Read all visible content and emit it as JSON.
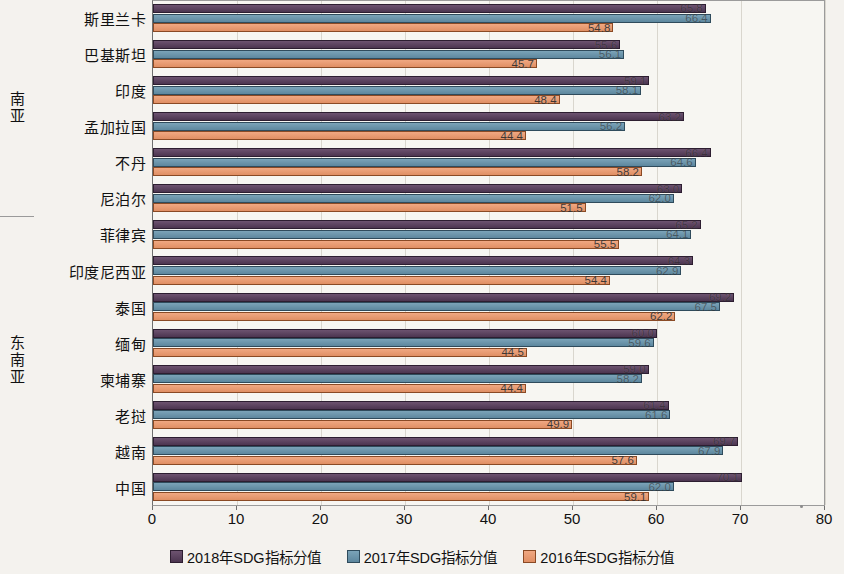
{
  "chart_data": {
    "type": "bar",
    "orientation": "horizontal",
    "title": "",
    "xlabel": "",
    "ylabel": "",
    "xlim": [
      0,
      80
    ],
    "xticks": [
      "0",
      "10",
      "20",
      "30",
      "40",
      "50",
      "60",
      "70",
      "80"
    ],
    "grid": true,
    "legend_position": "bottom",
    "categories": [
      "斯里兰卡",
      "巴基斯坦",
      "印度",
      "孟加拉国",
      "不丹",
      "尼泊尔",
      "菲律宾",
      "印度尼西亚",
      "泰国",
      "缅甸",
      "柬埔寨",
      "老挝",
      "越南",
      "中国"
    ],
    "groups": [
      {
        "label": "南亚",
        "categories": [
          "斯里兰卡",
          "巴基斯坦",
          "印度",
          "孟加拉国",
          "不丹",
          "尼泊尔"
        ]
      },
      {
        "label": "东南亚",
        "categories": [
          "菲律宾",
          "印度尼西亚",
          "泰国",
          "缅甸",
          "柬埔寨",
          "老挝",
          "越南",
          "中国"
        ]
      }
    ],
    "series": [
      {
        "name": "2018年SDG指标分值",
        "color": "#4c3550",
        "values": [
          65.8,
          55.6,
          59.1,
          63.2,
          66.4,
          63.0,
          65.2,
          64.3,
          69.2,
          60.0,
          59.0,
          61.4,
          69.7,
          70.1
        ],
        "labels": [
          "65.8",
          "55.6",
          "59.1",
          "63.2",
          "66.4",
          "63.0",
          "65.2",
          "64.3",
          "69.2",
          "60.0",
          "59.0",
          "61.4",
          "69.7",
          "70.1"
        ]
      },
      {
        "name": "2017年SDG指标分值",
        "color": "#5d879e",
        "values": [
          66.4,
          56.1,
          58.1,
          56.2,
          64.6,
          62.0,
          64.1,
          62.9,
          67.5,
          59.6,
          58.2,
          61.6,
          67.9,
          62.0
        ],
        "labels": [
          "66.4",
          "56.1",
          "58.1",
          "56.2",
          "64.6",
          "62.0",
          "64.1",
          "62.9",
          "67.5",
          "59.6",
          "58.2",
          "61.6",
          "67.9",
          "62.0"
        ]
      },
      {
        "name": "2016年SDG指标分值",
        "color": "#e08f64",
        "values": [
          54.8,
          45.7,
          48.4,
          44.4,
          58.2,
          51.5,
          55.5,
          54.4,
          62.2,
          44.5,
          44.4,
          49.9,
          57.6,
          59.1
        ],
        "labels": [
          "54.8",
          "45.7",
          "48.4",
          "44.4",
          "58.2",
          "51.5",
          "55.5",
          "54.4",
          "62.2",
          "44.5",
          "44.4",
          "49.9",
          "57.6",
          "59.1"
        ]
      }
    ]
  },
  "legend": {
    "items": [
      {
        "label": "2018年SDG指标分值",
        "key": "s2018"
      },
      {
        "label": "2017年SDG指标分值",
        "key": "s2017"
      },
      {
        "label": "2016年SDG指标分值",
        "key": "s2016"
      }
    ]
  }
}
